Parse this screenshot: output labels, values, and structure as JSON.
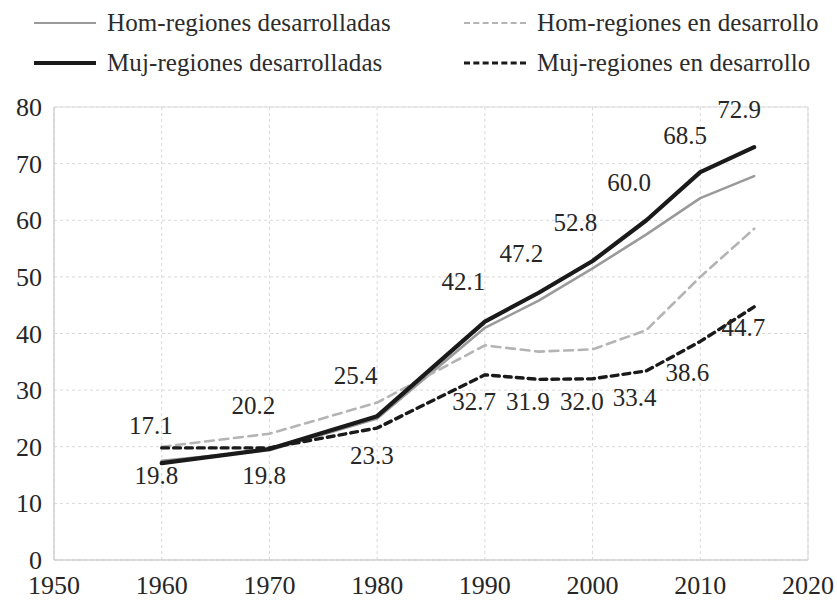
{
  "legend": {
    "position": "top",
    "items": [
      {
        "label": "Hom-regiones desarrolladas",
        "style": "solid-thin",
        "color": "#9a9a9a",
        "key": "hom_desarrolladas"
      },
      {
        "label": "Hom-regiones en desarrollo",
        "style": "dash-light",
        "color": "#b4b4b4",
        "key": "hom_en_desarrollo"
      },
      {
        "label": "Muj-regiones desarrolladas",
        "style": "solid-thick",
        "color": "#1a1a1a",
        "key": "muj_desarrolladas"
      },
      {
        "label": "Muj-regiones en desarrollo",
        "style": "dash-dark",
        "color": "#1a1a1a",
        "key": "muj_en_desarrollo"
      }
    ]
  },
  "chart_data": {
    "type": "line",
    "title": "",
    "xlabel": "",
    "ylabel": "",
    "xlim": [
      1950,
      2020
    ],
    "ylim": [
      0,
      80
    ],
    "xticks": [
      1950,
      1960,
      1970,
      1980,
      1990,
      2000,
      2010,
      2020
    ],
    "xtick_labels": [
      "1950",
      "1960",
      "1970",
      "1980",
      "1990",
      "2000",
      "2010",
      "2020"
    ],
    "yticks": [
      0,
      10,
      20,
      30,
      40,
      50,
      60,
      70,
      80
    ],
    "ytick_labels": [
      "0",
      "10",
      "20",
      "30",
      "40",
      "50",
      "60",
      "70",
      "80"
    ],
    "grid": true,
    "grid_color": "#d9d9d9",
    "legend_position": "top",
    "x": [
      1960,
      1970,
      1980,
      1990,
      1995,
      2000,
      2005,
      2010,
      2015
    ],
    "series": [
      {
        "name": "Hom-regiones desarrolladas",
        "style": "solid-thin",
        "color": "#9a9a9a",
        "width": 2.6,
        "values": [
          17.5,
          19.4,
          25.0,
          41.0,
          45.8,
          51.5,
          57.5,
          63.9,
          67.8
        ]
      },
      {
        "name": "Hom-regiones en desarrollo",
        "style": "dash-light",
        "color": "#b4b4b4",
        "width": 2.6,
        "values": [
          20.0,
          22.3,
          27.8,
          37.9,
          36.8,
          37.2,
          40.6,
          50.0,
          58.5
        ]
      },
      {
        "name": "Muj-regiones desarrolladas",
        "style": "solid-thick",
        "color": "#1a1a1a",
        "width": 4.2,
        "values": [
          17.1,
          19.6,
          25.4,
          42.1,
          47.2,
          52.8,
          60.0,
          68.5,
          72.9
        ]
      },
      {
        "name": "Muj-regiones en desarrollo",
        "style": "dash-dark",
        "color": "#1a1a1a",
        "width": 3.4,
        "values": [
          19.8,
          19.8,
          23.3,
          32.7,
          31.9,
          32.0,
          33.4,
          38.6,
          44.7
        ]
      }
    ],
    "data_labels": [
      {
        "text": "17.1",
        "x": 1959.0,
        "y": 22.2,
        "series": "Muj-regiones desarrolladas"
      },
      {
        "text": "19.8",
        "x": 1959.5,
        "y": 13.4,
        "series": "Muj-regiones en desarrollo"
      },
      {
        "text": "20.2",
        "x": 1968.5,
        "y": 25.7,
        "series": "Hom-regiones en desarrollo"
      },
      {
        "text": "19.8",
        "x": 1969.5,
        "y": 13.4,
        "series": "Muj-regiones en desarrollo"
      },
      {
        "text": "25.4",
        "x": 1978.0,
        "y": 31.0,
        "series": "Muj-regiones desarrolladas"
      },
      {
        "text": "23.3",
        "x": 1979.5,
        "y": 16.9,
        "series": "Muj-regiones en desarrollo"
      },
      {
        "text": "42.1",
        "x": 1988.0,
        "y": 47.6,
        "series": "Muj-regiones desarrolladas"
      },
      {
        "text": "32.7",
        "x": 1989.0,
        "y": 26.5,
        "series": "Muj-regiones en desarrollo"
      },
      {
        "text": "47.2",
        "x": 1993.4,
        "y": 52.7,
        "series": "Muj-regiones desarrolladas"
      },
      {
        "text": "31.9",
        "x": 1994.0,
        "y": 26.5,
        "series": "Muj-regiones en desarrollo"
      },
      {
        "text": "52.8",
        "x": 1998.4,
        "y": 58.1,
        "series": "Muj-regiones desarrolladas"
      },
      {
        "text": "32.0",
        "x": 1999.0,
        "y": 26.5,
        "series": "Muj-regiones en desarrollo"
      },
      {
        "text": "60.0",
        "x": 2003.4,
        "y": 65.2,
        "series": "Muj-regiones desarrolladas"
      },
      {
        "text": "33.4",
        "x": 2003.9,
        "y": 27.2,
        "series": "Muj-regiones en desarrollo"
      },
      {
        "text": "68.5",
        "x": 2008.6,
        "y": 73.5,
        "series": "Muj-regiones desarrolladas"
      },
      {
        "text": "38.6",
        "x": 2008.8,
        "y": 31.6,
        "series": "Muj-regiones en desarrollo"
      },
      {
        "text": "72.9",
        "x": 2013.6,
        "y": 78.0,
        "series": "Muj-regiones desarrolladas"
      },
      {
        "text": "44.7",
        "x": 2014.0,
        "y": 39.5,
        "series": "Muj-regiones en desarrollo"
      }
    ]
  }
}
